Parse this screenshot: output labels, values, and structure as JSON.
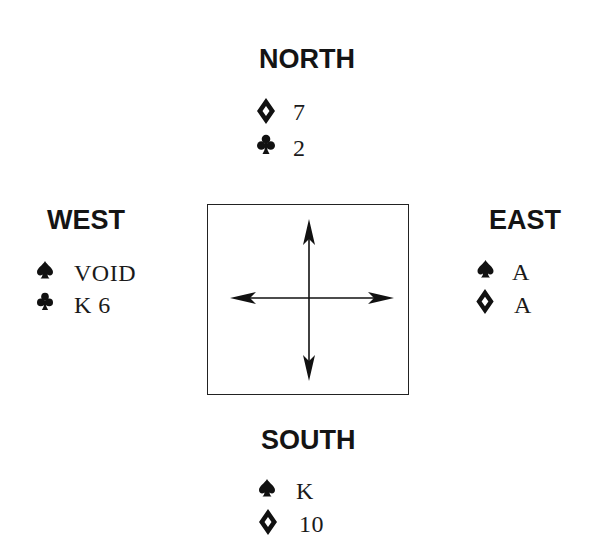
{
  "diagram": {
    "type": "bridge-deal",
    "colors": {
      "ink": "#141414",
      "background": "#ffffff"
    },
    "table": {
      "icon": "compass-arrows-icon"
    },
    "north": {
      "label": "NORTH",
      "holdings": [
        {
          "suit": "diamond",
          "suit_icon": "diamond-icon",
          "cards": "7"
        },
        {
          "suit": "club",
          "suit_icon": "club-icon",
          "cards": "2"
        }
      ]
    },
    "west": {
      "label": "WEST",
      "holdings": [
        {
          "suit": "spade",
          "suit_icon": "spade-icon",
          "cards": "VOID"
        },
        {
          "suit": "club",
          "suit_icon": "club-icon",
          "cards": "K 6"
        }
      ]
    },
    "east": {
      "label": "EAST",
      "holdings": [
        {
          "suit": "spade",
          "suit_icon": "spade-icon",
          "cards": "A"
        },
        {
          "suit": "diamond",
          "suit_icon": "diamond-icon",
          "cards": "A"
        }
      ]
    },
    "south": {
      "label": "SOUTH",
      "holdings": [
        {
          "suit": "spade",
          "suit_icon": "spade-icon",
          "cards": "K"
        },
        {
          "suit": "diamond",
          "suit_icon": "diamond-icon",
          "cards": "10"
        }
      ]
    }
  }
}
